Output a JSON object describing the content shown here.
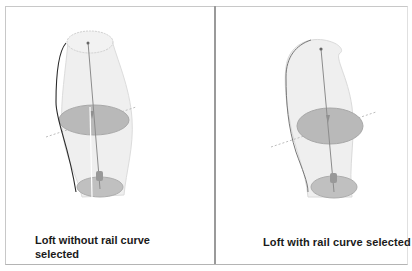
{
  "figure": {
    "panels": [
      {
        "id": "left",
        "caption": "Loft without rail curve selected",
        "rail_curve_selected": false
      },
      {
        "id": "right",
        "caption": "Loft with rail curve selected",
        "rail_curve_selected": true
      }
    ]
  },
  "colors": {
    "border": "#c8c8c8",
    "divider": "#9a9a9a",
    "loft_surface": "#eeeeee",
    "profile_fill": "#b8b8b8",
    "rail_curve_dark": "#222222",
    "axis_line": "#888888",
    "caption_text": "#1a1a1a"
  }
}
